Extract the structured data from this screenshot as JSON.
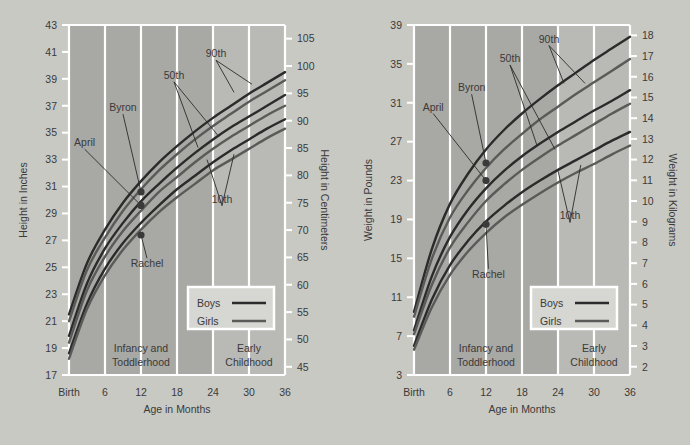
{
  "page": {
    "background_color": "#c9c9c4",
    "plot_band_dark": "#a8a8a4",
    "plot_band_light": "#b9b9b5",
    "gridline_color": "#ffffff",
    "curve_boys_color": "#2b2b2b",
    "curve_girls_color": "#5a5a58",
    "marker_color": "#3a3a3a",
    "text_color": "#3a3a3a"
  },
  "charts": [
    {
      "id": "height-chart",
      "left_axis_title": "Height in Inches",
      "right_axis_title": "Height in Centimeters",
      "x_axis_title": "Age in Months",
      "left_ticks": [
        "17",
        "19",
        "21",
        "23",
        "25",
        "27",
        "29",
        "31",
        "33",
        "35",
        "37",
        "39",
        "41",
        "43"
      ],
      "right_ticks": [
        "45",
        "50",
        "55",
        "60",
        "65",
        "70",
        "75",
        "80",
        "85",
        "90",
        "95",
        "100",
        "105"
      ],
      "x_ticks": [
        "Birth",
        "6",
        "12",
        "18",
        "24",
        "30",
        "36"
      ],
      "bands": [
        {
          "label_line1": "Infancy and",
          "label_line2": "Toddlerhood"
        },
        {
          "label_line1": "Early",
          "label_line2": "Childhood"
        }
      ],
      "percentile_labels": [
        "90th",
        "50th",
        "10th"
      ],
      "child_labels": [
        "April",
        "Byron",
        "Rachel"
      ],
      "legend": [
        {
          "label": "Boys"
        },
        {
          "label": "Girls"
        }
      ]
    },
    {
      "id": "weight-chart",
      "left_axis_title": "Weight in Pounds",
      "right_axis_title": "Weight in Kilograms",
      "x_axis_title": "Age in Months",
      "left_ticks": [
        "4",
        "8",
        "12",
        "16",
        "20",
        "24",
        "28",
        "32",
        "36"
      ],
      "right_ticks": [
        "2",
        "3",
        "4",
        "5",
        "6",
        "7",
        "8",
        "9",
        "10",
        "11",
        "12",
        "13",
        "14",
        "15",
        "16",
        "17",
        "18"
      ],
      "x_ticks": [
        "Birth",
        "6",
        "12",
        "18",
        "24",
        "30",
        "36"
      ],
      "bands": [
        {
          "label_line1": "Infancy and",
          "label_line2": "Toddlerhood"
        },
        {
          "label_line1": "Early",
          "label_line2": "Childhood"
        }
      ],
      "percentile_labels": [
        "90th",
        "50th",
        "10th"
      ],
      "child_labels": [
        "April",
        "Byron",
        "Rachel"
      ],
      "legend": [
        {
          "label": "Boys"
        },
        {
          "label": "Girls"
        }
      ]
    }
  ],
  "chart_data": [
    {
      "type": "line",
      "title": "Height in Inches",
      "xlabel": "Age in Months",
      "ylabel": "Height in Inches",
      "y2label": "Height in Centimeters",
      "x": [
        0,
        3,
        6,
        9,
        12,
        15,
        18,
        21,
        24,
        27,
        30,
        33,
        36
      ],
      "xtick_labels": [
        "Birth",
        "6",
        "12",
        "18",
        "24",
        "30",
        "36"
      ],
      "xtick_values": [
        0,
        6,
        12,
        18,
        24,
        30,
        36
      ],
      "ylim": [
        17,
        43
      ],
      "ytick_step": 2,
      "y2lim": [
        43.5,
        107.5
      ],
      "y2ticks": [
        45,
        50,
        55,
        60,
        65,
        70,
        75,
        80,
        85,
        90,
        95,
        100,
        105
      ],
      "grid": true,
      "legend_position": "bottom-right",
      "series": [
        {
          "name": "Boys 90th",
          "group": "Boys",
          "percentile": "90th",
          "color": "#2b2b2b",
          "values": [
            21.5,
            25.3,
            27.8,
            29.8,
            31.4,
            32.8,
            34.0,
            35.1,
            36.1,
            37.0,
            37.9,
            38.7,
            39.5
          ]
        },
        {
          "name": "Girls 90th",
          "group": "Girls",
          "percentile": "90th",
          "color": "#5a5a58",
          "values": [
            21.0,
            24.8,
            27.2,
            29.2,
            30.8,
            32.2,
            33.4,
            34.5,
            35.5,
            36.4,
            37.3,
            38.1,
            38.9
          ]
        },
        {
          "name": "Boys 50th",
          "group": "Boys",
          "percentile": "50th",
          "color": "#2b2b2b",
          "values": [
            19.9,
            23.8,
            26.4,
            28.3,
            29.9,
            31.2,
            32.4,
            33.5,
            34.5,
            35.4,
            36.2,
            37.0,
            37.8
          ]
        },
        {
          "name": "Girls 50th",
          "group": "Girls",
          "percentile": "50th",
          "color": "#5a5a58",
          "values": [
            19.4,
            23.3,
            25.8,
            27.7,
            29.2,
            30.6,
            31.7,
            32.8,
            33.8,
            34.7,
            35.5,
            36.3,
            37.0
          ]
        },
        {
          "name": "Boys 10th",
          "group": "Boys",
          "percentile": "10th",
          "color": "#2b2b2b",
          "values": [
            18.6,
            22.3,
            24.9,
            26.8,
            28.3,
            29.6,
            30.8,
            31.8,
            32.8,
            33.7,
            34.5,
            35.3,
            36.0
          ]
        },
        {
          "name": "Girls 10th",
          "group": "Girls",
          "percentile": "10th",
          "color": "#5a5a58",
          "values": [
            18.2,
            21.9,
            24.4,
            26.3,
            27.8,
            29.1,
            30.2,
            31.2,
            32.2,
            33.0,
            33.8,
            34.6,
            35.3
          ]
        }
      ],
      "annotations": [
        {
          "text": "90th",
          "x": 24.5,
          "y": 40.6
        },
        {
          "text": "50th",
          "x": 17.5,
          "y": 39.0
        },
        {
          "text": "10th",
          "x": 25.5,
          "y": 29.8
        },
        {
          "text": "April",
          "x": 3.0,
          "y": 34.2
        },
        {
          "text": "Byron",
          "x": 9.2,
          "y": 36.6
        },
        {
          "text": "Rachel",
          "x": 13.0,
          "y": 25.0
        }
      ],
      "points": [
        {
          "name": "Byron",
          "x": 12,
          "y": 30.6
        },
        {
          "name": "April",
          "x": 12,
          "y": 29.6
        },
        {
          "name": "Rachel",
          "x": 12,
          "y": 27.4
        }
      ],
      "band_regions": [
        {
          "from": 0,
          "to": 24,
          "label": "Infancy and Toddlerhood",
          "shade": "dark"
        },
        {
          "from": 24,
          "to": 36,
          "label": "Early Childhood",
          "shade": "light"
        }
      ]
    },
    {
      "type": "line",
      "title": "Weight in Pounds",
      "xlabel": "Age in Months",
      "ylabel": "Weight in Pounds",
      "y2label": "Weight in Kilograms",
      "x": [
        0,
        3,
        6,
        9,
        12,
        15,
        18,
        21,
        24,
        27,
        30,
        33,
        36
      ],
      "xtick_labels": [
        "Birth",
        "6",
        "12",
        "18",
        "24",
        "30",
        "36"
      ],
      "xtick_values": [
        0,
        6,
        12,
        18,
        24,
        30,
        36
      ],
      "ylim": [
        3.0,
        39.0
      ],
      "ytick_step": 4,
      "y2lim": [
        1.6,
        18.5
      ],
      "y2ticks": [
        2,
        3,
        4,
        5,
        6,
        7,
        8,
        9,
        10,
        11,
        12,
        13,
        14,
        15,
        16,
        17,
        18
      ],
      "grid": true,
      "legend_position": "bottom-right",
      "series": [
        {
          "name": "Boys 90th",
          "group": "Boys",
          "percentile": "90th",
          "color": "#2b2b2b",
          "values": [
            9.5,
            16.0,
            20.6,
            23.7,
            26.2,
            28.2,
            29.9,
            31.4,
            32.8,
            34.1,
            35.4,
            36.6,
            37.8
          ]
        },
        {
          "name": "Girls 90th",
          "group": "Girls",
          "percentile": "90th",
          "color": "#5a5a58",
          "values": [
            9.0,
            15.0,
            19.2,
            22.0,
            24.3,
            26.2,
            27.8,
            29.3,
            30.6,
            31.9,
            33.1,
            34.3,
            35.5
          ]
        },
        {
          "name": "Boys 50th",
          "group": "Boys",
          "percentile": "50th",
          "color": "#2b2b2b",
          "values": [
            7.6,
            13.2,
            17.2,
            20.0,
            22.2,
            24.0,
            25.5,
            26.8,
            28.0,
            29.1,
            30.2,
            31.2,
            32.3
          ]
        },
        {
          "name": "Girls 50th",
          "group": "Girls",
          "percentile": "50th",
          "color": "#5a5a58",
          "values": [
            7.2,
            12.3,
            16.1,
            18.7,
            20.9,
            22.6,
            24.1,
            25.4,
            26.6,
            27.7,
            28.8,
            29.9,
            30.9
          ]
        },
        {
          "name": "Boys 10th",
          "group": "Boys",
          "percentile": "10th",
          "color": "#2b2b2b",
          "values": [
            6.0,
            10.8,
            14.3,
            16.8,
            18.8,
            20.4,
            21.8,
            23.0,
            24.1,
            25.1,
            26.1,
            27.1,
            28.0
          ]
        },
        {
          "name": "Girls 10th",
          "group": "Girls",
          "percentile": "10th",
          "color": "#5a5a58",
          "values": [
            5.6,
            10.0,
            13.3,
            15.7,
            17.6,
            19.2,
            20.5,
            21.7,
            22.8,
            23.8,
            24.7,
            25.7,
            26.6
          ]
        }
      ],
      "annotations": [
        {
          "text": "90th",
          "x": 22.5,
          "y": 38.0
        },
        {
          "text": "50th",
          "x": 16.0,
          "y": 36.0
        },
        {
          "text": "10th",
          "x": 26.0,
          "y": 19.5
        },
        {
          "text": "April",
          "x": 3.5,
          "y": 30.5
        },
        {
          "text": "Byron",
          "x": 9.5,
          "y": 32.3
        },
        {
          "text": "Rachel",
          "x": 12.6,
          "y": 13.2
        },
        {
          "text": "April",
          "x": 3.5,
          "y": 30.5
        }
      ],
      "points": [
        {
          "name": "Byron",
          "x": 12,
          "y": 24.8
        },
        {
          "name": "April",
          "x": 12,
          "y": 23.0
        },
        {
          "name": "Rachel",
          "x": 12,
          "y": 18.5
        }
      ],
      "band_regions": [
        {
          "from": 0,
          "to": 24,
          "label": "Infancy and Toddlerhood",
          "shade": "dark"
        },
        {
          "from": 24,
          "to": 36,
          "label": "Early Childhood",
          "shade": "light"
        }
      ]
    }
  ]
}
